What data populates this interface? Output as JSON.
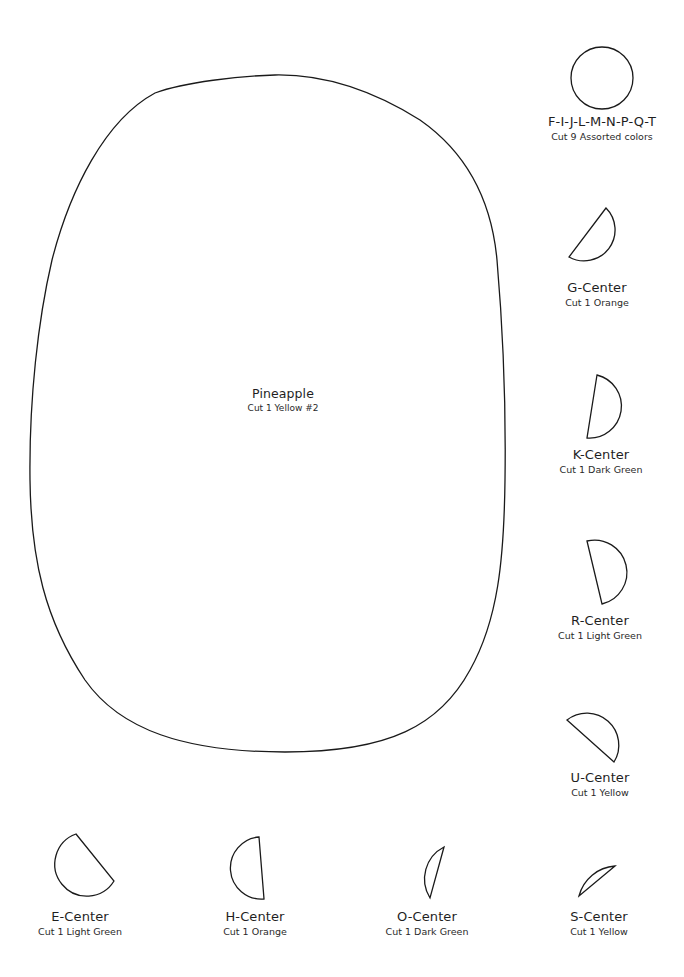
{
  "document": {
    "type": "applique pattern template",
    "background": "#ffffff",
    "stroke_color": "#1a1a1a"
  },
  "pieces": {
    "pineapple": {
      "name": "Pineapple",
      "cut": "Cut 1 Yellow #2",
      "shape": "large rounded oval"
    },
    "fijlmnpqt": {
      "name": "F-I-J-L-M-N-P-Q-T",
      "cut": "Cut 9 Assorted colors",
      "shape": "circle"
    },
    "g_center": {
      "name": "G-Center",
      "cut": "Cut 1 Orange",
      "shape": "half-circle"
    },
    "k_center": {
      "name": "K-Center",
      "cut": "Cut 1 Dark Green",
      "shape": "half-circle"
    },
    "r_center": {
      "name": "R-Center",
      "cut": "Cut 1 Light Green",
      "shape": "half-circle"
    },
    "u_center": {
      "name": "U-Center",
      "cut": "Cut 1 Yellow",
      "shape": "half-circle"
    },
    "e_center": {
      "name": "E-Center",
      "cut": "Cut 1 Light Green",
      "shape": "three-quarter circle"
    },
    "h_center": {
      "name": "H-Center",
      "cut": "Cut 1 Orange",
      "shape": "half-circle"
    },
    "o_center": {
      "name": "O-Center",
      "cut": "Cut 1 Dark Green",
      "shape": "crescent sliver"
    },
    "s_center": {
      "name": "S-Center",
      "cut": "Cut 1 Yellow",
      "shape": "crescent sliver"
    }
  }
}
